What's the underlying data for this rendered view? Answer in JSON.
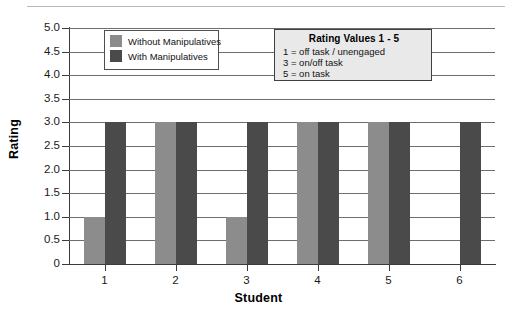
{
  "chart_data": {
    "type": "bar",
    "title": "",
    "xlabel": "Student",
    "ylabel": "Rating",
    "categories": [
      "1",
      "2",
      "3",
      "4",
      "5",
      "6"
    ],
    "series": [
      {
        "name": "Without Manipulatives",
        "color": "#8c8c8c",
        "values": [
          1,
          3,
          1,
          3,
          3,
          0
        ]
      },
      {
        "name": "With Manipulatives",
        "color": "#4a4a4a",
        "values": [
          3,
          3,
          3,
          3,
          3,
          3
        ]
      }
    ],
    "ylim": [
      0,
      5
    ],
    "ytick_labels": [
      "0",
      "0.5",
      "1.0",
      "1.5",
      "2.0",
      "2.5",
      "3.0",
      "3.5",
      "4.0",
      "4.5",
      "5.0"
    ],
    "ytick_values": [
      0,
      0.5,
      1.0,
      1.5,
      2.0,
      2.5,
      3.0,
      3.5,
      4.0,
      4.5,
      5.0
    ],
    "grid": true,
    "legend_position": "upper-left"
  },
  "legend": {
    "items": [
      {
        "label": "Without Manipulatives",
        "color": "#8c8c8c"
      },
      {
        "label": "With Manipulatives",
        "color": "#4a4a4a"
      }
    ]
  },
  "note": {
    "title": "Rating Values 1 - 5",
    "lines": [
      "1 = off task / unengaged",
      "3 = on/off task",
      "5 = on task"
    ]
  }
}
